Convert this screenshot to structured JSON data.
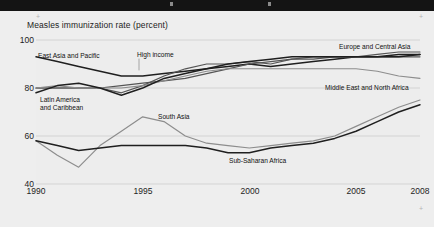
{
  "header": {
    "band_color": "#141414"
  },
  "chart_title": "Measles immunization rate (percent)",
  "axis": {
    "y_ticks": [
      "100",
      "80",
      "60",
      "40"
    ],
    "x_ticks": [
      "1990",
      "1995",
      "2000",
      "2005",
      "2008"
    ]
  },
  "colors": {
    "background": "#eeeeee",
    "plot_background": "#ededed",
    "gridline": "#c8c8c8",
    "line_dark": "#1f1f1f",
    "line_mid": "#555555",
    "line_light": "#8d8d8d",
    "text": "#1d1d1d"
  },
  "series_labels": [
    {
      "name": "east-asia-and-pacific",
      "text": "East Asia and Pacific"
    },
    {
      "name": "high-income",
      "text": "High income"
    },
    {
      "name": "europe-and-central-asia",
      "text": "Europe and Central Asia"
    },
    {
      "name": "middle-east-and-north-africa",
      "text": "Middle East and North Africa"
    },
    {
      "name": "latin-america-and-caribbean-line1",
      "text": "Latin America"
    },
    {
      "name": "latin-america-and-caribbean-line2",
      "text": "and Caribbean"
    },
    {
      "name": "south-asia",
      "text": "South Asia"
    },
    {
      "name": "sub-saharan-africa",
      "text": "Sub-Saharan Africa"
    }
  ],
  "chart_data": {
    "type": "line",
    "title": "Measles immunization rate (percent)",
    "xlabel": "",
    "ylabel": "Measles immunization rate (percent)",
    "xlim": [
      1990,
      2008
    ],
    "ylim": [
      40,
      100
    ],
    "ytick_values": [
      40,
      60,
      80,
      100
    ],
    "xtick_values": [
      1990,
      1995,
      2000,
      2005,
      2008
    ],
    "grid": "horizontal",
    "legend": "inline-annotations",
    "x": [
      1990,
      1991,
      1992,
      1993,
      1994,
      1995,
      1996,
      1997,
      1998,
      1999,
      2000,
      2001,
      2002,
      2003,
      2004,
      2005,
      2006,
      2007,
      2008
    ],
    "series": [
      {
        "name": "East Asia and Pacific",
        "values": [
          93,
          91,
          89,
          87,
          85,
          85,
          86,
          87,
          88,
          89,
          90,
          89,
          90,
          91,
          92,
          93,
          93,
          94,
          94
        ]
      },
      {
        "name": "High income",
        "values": [
          80,
          80,
          80,
          80,
          81,
          82,
          83,
          84,
          86,
          88,
          90,
          91,
          92,
          92,
          93,
          93,
          93,
          93,
          93
        ]
      },
      {
        "name": "Europe and Central Asia",
        "values": [
          80,
          80,
          80,
          80,
          78,
          81,
          85,
          88,
          90,
          90,
          91,
          90,
          92,
          93,
          93,
          93,
          94,
          95,
          95
        ]
      },
      {
        "name": "Middle East and North Africa",
        "values": [
          80,
          81,
          80,
          80,
          80,
          81,
          83,
          85,
          87,
          88,
          88,
          88,
          88,
          88,
          88,
          88,
          87,
          85,
          84
        ]
      },
      {
        "name": "Latin America and Caribbean",
        "values": [
          78,
          81,
          82,
          80,
          77,
          80,
          84,
          86,
          88,
          90,
          91,
          92,
          93,
          93,
          93,
          93,
          93,
          93,
          94
        ]
      },
      {
        "name": "South Asia",
        "values": [
          58,
          52,
          47,
          56,
          62,
          68,
          66,
          60,
          57,
          56,
          55,
          56,
          57,
          58,
          60,
          64,
          68,
          72,
          75
        ]
      },
      {
        "name": "Sub-Saharan Africa",
        "values": [
          58,
          56,
          54,
          55,
          56,
          56,
          56,
          56,
          55,
          53,
          53,
          55,
          56,
          57,
          59,
          62,
          66,
          70,
          73
        ]
      }
    ]
  }
}
